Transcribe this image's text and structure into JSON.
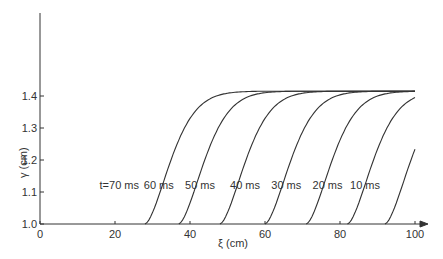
{
  "chart_data": {
    "type": "line",
    "title": "",
    "xlabel": "ξ (cm)",
    "ylabel": "γ (cm)",
    "xlim": [
      0,
      100
    ],
    "ylim": [
      1.0,
      1.45
    ],
    "xticks": [
      "0",
      "20",
      "40",
      "60",
      "80",
      "100"
    ],
    "yticks": [
      "1.0",
      "1.1",
      "1.2",
      "1.3",
      "1.4"
    ],
    "grid": false,
    "legend": "inline labels",
    "series": [
      {
        "name": "t=70 ms",
        "start_x": 28,
        "end_y": 1.41
      },
      {
        "name": "60 ms",
        "start_x": 37,
        "end_y": 1.405
      },
      {
        "name": "50 ms",
        "start_x": 48,
        "end_y": 1.4
      },
      {
        "name": "40 ms",
        "start_x": 60,
        "end_y": 1.39
      },
      {
        "name": "30 ms",
        "start_x": 71,
        "end_y": 1.37
      },
      {
        "name": "20 ms",
        "start_x": 82,
        "end_y": 1.32
      },
      {
        "name": "10 ms",
        "start_x": 92,
        "end_y": 1.17
      }
    ]
  }
}
